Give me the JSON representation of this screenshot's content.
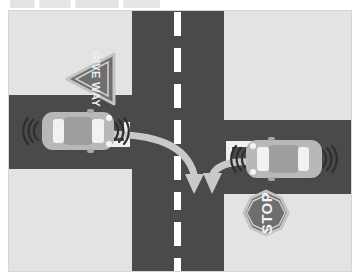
{
  "page": {
    "heading_fragment": "",
    "background_color": "#ffffff"
  },
  "figure": {
    "name": "intersection-right-of-way-diagram",
    "caption": "Top-down view of a crossroads intersection with two cars approaching from opposite side roads",
    "colors": {
      "grass": "#e3e3e3",
      "road": "#4a4a4a",
      "road_marking": "#ffffff",
      "car_body": "#b8b8b8",
      "car_glass": "#f2f2f2",
      "sign_fill": "#6e6e6e",
      "sign_border": "#bcbcbc",
      "sign_text": "#f0f0f0",
      "arrow": "#c9c9c9",
      "frame_border": "#d0d0d0"
    },
    "roads": {
      "vertical": {
        "name": "main-road-vertical",
        "centerline_style": "dashed",
        "dash_count": 9
      },
      "horizontal_left": {
        "name": "side-road-left"
      },
      "horizontal_right": {
        "name": "side-road-right"
      }
    },
    "signs": [
      {
        "id": "give-way-sign",
        "label": "GIVE WAY",
        "shape": "triangle",
        "rotation_deg": 90,
        "points_direction": "left"
      },
      {
        "id": "stop-sign",
        "label": "STOP",
        "shape": "octagon",
        "rotation_deg": -90
      }
    ],
    "vehicles": [
      {
        "id": "car-left",
        "heading": "east",
        "description": "Car approaching intersection from the left side road",
        "has_motion_waves": true
      },
      {
        "id": "car-right",
        "heading": "west",
        "description": "Car approaching intersection from the right side road",
        "has_motion_waves": true
      }
    ],
    "arrows": [
      {
        "id": "arrow-left-car-path",
        "from": "car-left",
        "to": "intersection-center",
        "shape": "curved-right-turn",
        "direction": "down"
      },
      {
        "id": "arrow-right-car-path",
        "from": "car-right",
        "to": "intersection-center",
        "shape": "curved-left-turn",
        "direction": "down"
      }
    ],
    "stop_lines": [
      {
        "id": "stop-line-left",
        "associated_with": "car-left"
      },
      {
        "id": "stop-line-right",
        "associated_with": "car-right"
      }
    ]
  }
}
